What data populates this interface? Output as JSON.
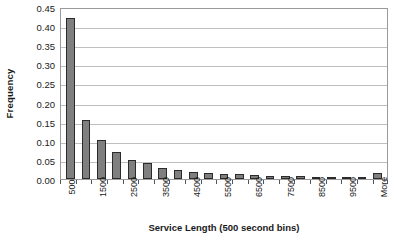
{
  "chart_data": {
    "type": "bar",
    "title": "",
    "xlabel": "Service Length (500 second bins)",
    "ylabel": "Frequency",
    "ylim": [
      0,
      0.45
    ],
    "ytick_labels": [
      "0.45",
      "0.40",
      "0.35",
      "0.30",
      "0.25",
      "0.20",
      "0.15",
      "0.10",
      "0.05",
      "0.00"
    ],
    "ytick_values": [
      0.45,
      0.4,
      0.35,
      0.3,
      0.25,
      0.2,
      0.15,
      0.1,
      0.05,
      0.0
    ],
    "grid": true,
    "legend": "none",
    "bar_color": "#7f7f7f",
    "bar_edge_color": "#2b2b2b",
    "categories": [
      "500",
      "1000",
      "1500",
      "2000",
      "2500",
      "3000",
      "3500",
      "4000",
      "4500",
      "5000",
      "5500",
      "6000",
      "6500",
      "7000",
      "7500",
      "8000",
      "8500",
      "9000",
      "9500",
      "10000",
      "More"
    ],
    "visible_tick_labels": [
      "500",
      "",
      "1500",
      "",
      "2500",
      "",
      "3500",
      "",
      "4500",
      "",
      "5500",
      "",
      "6500",
      "",
      "7500",
      "",
      "8500",
      "",
      "9500",
      "",
      "More"
    ],
    "values": [
      0.421,
      0.155,
      0.102,
      0.07,
      0.051,
      0.041,
      0.03,
      0.024,
      0.018,
      0.015,
      0.013,
      0.012,
      0.01,
      0.009,
      0.008,
      0.007,
      0.006,
      0.006,
      0.005,
      0.004,
      0.016
    ]
  }
}
